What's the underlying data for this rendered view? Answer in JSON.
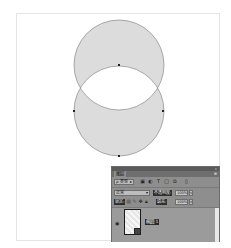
{
  "canvas": {
    "background": "#ffffff",
    "shape": {
      "type": "ellipse-xor",
      "fill": "#dcdcdc",
      "stroke": "#8a8a8a",
      "circle_top": {
        "cx": 119,
        "cy": 65,
        "r": 45
      },
      "circle_bottom": {
        "cx": 119,
        "cy": 111,
        "r": 45
      },
      "anchor_points": [
        {
          "x": 119,
          "y": 65
        },
        {
          "x": 74,
          "y": 111
        },
        {
          "x": 163,
          "y": 111
        },
        {
          "x": 119,
          "y": 156
        }
      ]
    }
  },
  "layers_panel": {
    "tab_label": "图层",
    "filter": {
      "label": "ρ 类型",
      "arrow": "▸"
    },
    "filter_icons": [
      "pixel-filter-icon",
      "adjustment-filter-icon",
      "type-filter-icon",
      "shape-filter-icon",
      "smart-object-filter-icon"
    ],
    "blend_mode": {
      "value": "正常",
      "arrow": "▾"
    },
    "opacity": {
      "label": "不透明度:",
      "value": "100%",
      "arrow": "▾"
    },
    "lock": {
      "label": "锁定:"
    },
    "fill": {
      "label": "填充:",
      "value": "100%",
      "arrow": "▾"
    },
    "layers": [
      {
        "name": "椭圆 1",
        "visible": true
      }
    ],
    "colors": {
      "titlebar": "#5b5b5b",
      "tabbar": "#6e6e6e",
      "body": "#8e8e8e",
      "layer_bg": "#9b9b9b"
    }
  }
}
